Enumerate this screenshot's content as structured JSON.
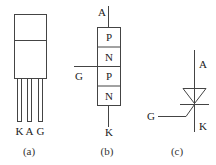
{
  "figure_a": {
    "caption": "(a)",
    "pin_labels": [
      "K",
      "A",
      "G"
    ]
  },
  "figure_b": {
    "caption": "(b)",
    "terminal_top": "A",
    "terminal_gate": "G",
    "terminal_bottom": "K",
    "layers": [
      "P",
      "N",
      "P",
      "N"
    ]
  },
  "figure_c": {
    "caption": "(c)",
    "terminal_anode": "A",
    "terminal_cathode": "K",
    "terminal_gate": "G"
  },
  "colors": {
    "line": "#444444",
    "text": "#222222",
    "background": "#ffffff"
  }
}
